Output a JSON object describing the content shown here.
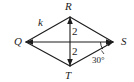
{
  "figure": {
    "type": "geometry-diagram",
    "shape": "rhombus",
    "background_color": "#ffffff",
    "stroke_color": "#1c1c1c",
    "vertices": [
      {
        "name": "Q",
        "label": "Q",
        "x": 26,
        "y": 42
      },
      {
        "name": "R",
        "label": "R",
        "x": 70,
        "y": 17
      },
      {
        "name": "S",
        "label": "S",
        "x": 113,
        "y": 42
      },
      {
        "name": "T",
        "label": "T",
        "x": 70,
        "y": 66
      }
    ],
    "sides": [
      {
        "from": "Q",
        "to": "R",
        "label": "k"
      },
      {
        "from": "R",
        "to": "S",
        "label": ""
      },
      {
        "from": "S",
        "to": "T",
        "label": ""
      },
      {
        "from": "T",
        "to": "Q",
        "label": ""
      }
    ],
    "diagonals": [
      {
        "from": "Q",
        "to": "S",
        "label": ""
      },
      {
        "from": "R",
        "to": "T",
        "label": ""
      }
    ],
    "segment_labels": [
      {
        "name": "upper-half-diagonal",
        "text": "2"
      },
      {
        "name": "lower-half-diagonal",
        "text": "2"
      }
    ],
    "side_labels": [
      {
        "name": "side-qr",
        "text": "k"
      }
    ],
    "angles": [
      {
        "name": "angle-at-s",
        "text": "30°",
        "vertex": "S"
      }
    ],
    "labels": {
      "Q": "Q",
      "R": "R",
      "S": "S",
      "T": "T",
      "k": "k",
      "two_upper": "2",
      "two_lower": "2",
      "angle_s": "30°"
    }
  }
}
